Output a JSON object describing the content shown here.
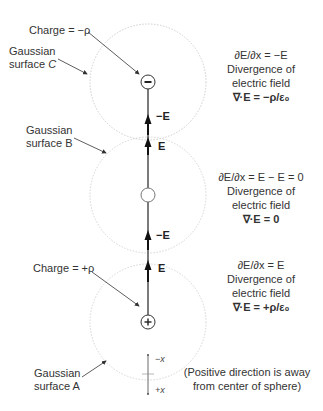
{
  "diagram": {
    "type": "gauss-law-divergence-illustration",
    "surfaces": [
      {
        "id": "C",
        "label_line1": "Gaussian",
        "label_line2": "surface ",
        "label_letter": "C",
        "charge_sign": "minus",
        "charge_label": "Charge = −ρ"
      },
      {
        "id": "B",
        "label_line1": "Gaussian",
        "label_line2": "surface B",
        "charge_sign": "none"
      },
      {
        "id": "A",
        "label_line1": "Gaussian",
        "label_line2": "surface A",
        "charge_sign": "plus",
        "charge_label": "Charge = +ρ"
      }
    ],
    "field_labels": {
      "top_arrow": "−E",
      "c_bottom_arrow": "E",
      "b_top_arrow": "E",
      "b_bottom_arrow": "−E",
      "a_top_arrow": "E"
    },
    "equations": {
      "C": {
        "derivative": "∂E/∂x = −E",
        "line2": "Divergence of",
        "line3": "electric field",
        "divergence": "∇·E = −ρ/ε₀"
      },
      "B": {
        "derivative": "∂E/∂x = E − E = 0",
        "line2": "Divergence of",
        "line3": "electric field",
        "divergence": "∇·E = 0"
      },
      "A": {
        "derivative": "∂E/∂x = E",
        "line2": "Divergence of",
        "line3": "electric field",
        "divergence": "∇·E = +ρ/ε₀"
      }
    },
    "axis": {
      "neg_label": "−x",
      "pos_label": "+x"
    },
    "note": {
      "line1": "(Positive direction is away",
      "line2": "from center of sphere)"
    },
    "colors": {
      "circle": "#cfcfcf",
      "line": "#222222",
      "pointer": "#333333",
      "text": "#333333"
    }
  }
}
